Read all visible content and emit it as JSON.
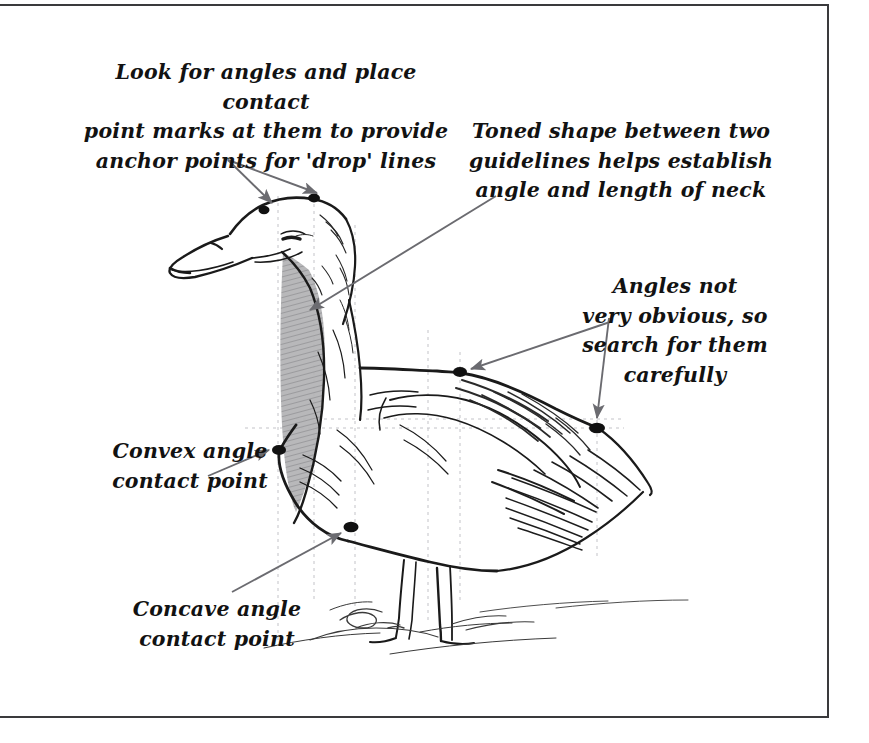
{
  "page": {
    "title": "Look for angles and place contact point marks",
    "background_color": "#ffffff",
    "frame_color": "#3a3a3c",
    "width": 869,
    "height": 743
  },
  "annotations": {
    "look_for_angles": {
      "text": "Look for angles and place contact\npoint marks at them to provide\nanchor points for 'drop' lines",
      "arrow_count": 2
    },
    "toned_shape": {
      "text": "Toned shape between two\nguidelines helps establish\nangle and length of neck",
      "arrow_count": 1
    },
    "angles_not_obvious": {
      "text": "Angles not\nvery obvious, so\nsearch for them\ncarefully",
      "arrow_count": 2
    },
    "convex_angle": {
      "text": "Convex angle\ncontact point",
      "arrow_count": 1
    },
    "concave_angle": {
      "text": "Concave angle\ncontact point",
      "arrow_count": 1
    }
  },
  "drawing": {
    "subject": "duck",
    "medium": "pen and ink sketch",
    "arrow_color": "#6b6b70",
    "ink_color": "#1a1a1a",
    "tone_color": "#a9a9ab",
    "guideline_color": "#bdbdc2",
    "contact_points": [
      {
        "name": "head-crown-front",
        "x": 264,
        "y": 210
      },
      {
        "name": "head-crown-back",
        "x": 314,
        "y": 198
      },
      {
        "name": "breast-convex",
        "x": 278,
        "y": 448
      },
      {
        "name": "belly-concave",
        "x": 350,
        "y": 525
      },
      {
        "name": "back-shoulder",
        "x": 460,
        "y": 372
      },
      {
        "name": "tail-base",
        "x": 597,
        "y": 427
      }
    ],
    "guidelines": {
      "vertical": [
        278,
        314,
        355,
        428,
        460,
        597
      ],
      "horizontal": [
        428
      ]
    }
  }
}
